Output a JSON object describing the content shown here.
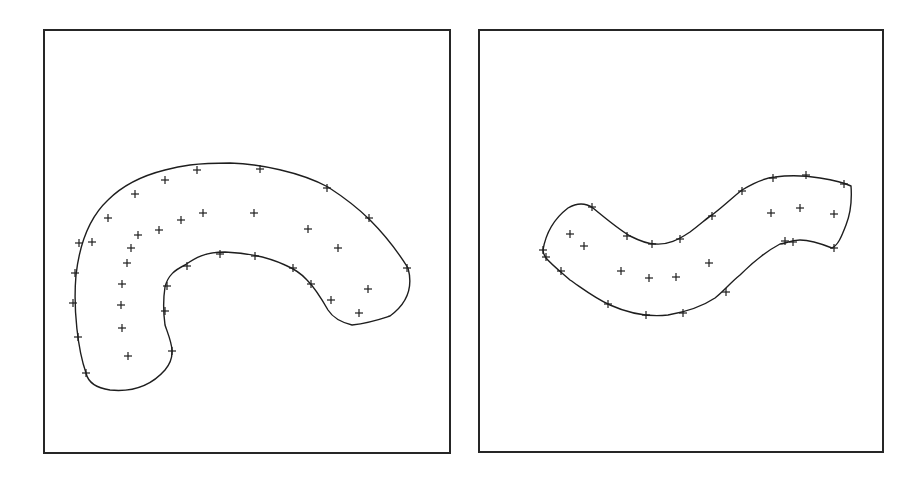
{
  "figure": {
    "panels": [
      {
        "id": "left",
        "shape": "C-shaped curved band",
        "outline_path": "M86,373 C78,350 73,310 76,275 C80,240 92,215 108,200 C125,183 145,175 165,170 C180,166 195,163 230,163 C260,164 300,172 328,187 C345,198 360,210 370,220 C385,235 398,252 408,268 C414,290 405,305 390,316 C378,320 370,323 352,325 C340,322 333,318 328,310 C320,296 312,285 307,280 C300,272 292,268 285,265 C270,258 250,253 225,252 C205,252 195,258 185,265 C175,270 168,275 165,287 C163,300 163,310 165,325 C170,340 178,355 165,370 C150,387 130,392 110,390 C96,388 88,382 86,373 Z",
        "boundary_points": [
          [
            86,
            373
          ],
          [
            78,
            337
          ],
          [
            73,
            303
          ],
          [
            75,
            273
          ],
          [
            79,
            243
          ],
          [
            92,
            242
          ],
          [
            108,
            218
          ],
          [
            135,
            194
          ],
          [
            165,
            180
          ],
          [
            197,
            170
          ],
          [
            260,
            169
          ],
          [
            327,
            188
          ],
          [
            369,
            218
          ],
          [
            407,
            268
          ],
          [
            359,
            313
          ],
          [
            331,
            300
          ],
          [
            311,
            284
          ],
          [
            293,
            268
          ],
          [
            255,
            256
          ],
          [
            220,
            254
          ],
          [
            187,
            266
          ],
          [
            167,
            286
          ],
          [
            165,
            311
          ],
          [
            172,
            351
          ]
        ],
        "interior_points": [
          [
            128,
            356
          ],
          [
            122,
            328
          ],
          [
            121,
            305
          ],
          [
            122,
            284
          ],
          [
            127,
            263
          ],
          [
            131,
            248
          ],
          [
            138,
            235
          ],
          [
            159,
            230
          ],
          [
            181,
            220
          ],
          [
            203,
            213
          ],
          [
            254,
            213
          ],
          [
            308,
            229
          ],
          [
            338,
            248
          ],
          [
            368,
            289
          ]
        ]
      },
      {
        "id": "right",
        "shape": "S-shaped curved band",
        "outline_path": "M543,250 C546,232 555,218 568,208 C578,202 586,203 593,208 C605,218 620,230 630,236 C640,241 648,244 655,244 C668,245 678,240 690,232 C702,223 708,217 712,215 C724,206 733,197 742,190 C755,182 765,178 775,177 C790,175 808,176 820,178 C833,180 843,182 851,186 C852,200 850,215 846,225 C841,238 838,245 832,248 C822,244 810,240 800,240 C790,240 785,244 780,244 C765,252 755,260 740,275 C730,283 725,290 715,298 C700,308 685,312 668,315 C650,317 630,314 610,305 C593,297 582,288 570,280 C561,272 552,265 546,258 C544,255 543,252 543,250 Z",
        "boundary_points": [
          [
            543,
            250
          ],
          [
            546,
            257
          ],
          [
            561,
            271
          ],
          [
            592,
            207
          ],
          [
            627,
            236
          ],
          [
            652,
            244
          ],
          [
            680,
            239
          ],
          [
            712,
            216
          ],
          [
            742,
            191
          ],
          [
            773,
            178
          ],
          [
            806,
            175
          ],
          [
            844,
            184
          ],
          [
            834,
            248
          ],
          [
            793,
            242
          ],
          [
            785,
            241
          ],
          [
            726,
            292
          ],
          [
            683,
            313
          ],
          [
            646,
            315
          ],
          [
            608,
            304
          ]
        ],
        "interior_points": [
          [
            570,
            234
          ],
          [
            584,
            246
          ],
          [
            621,
            271
          ],
          [
            649,
            278
          ],
          [
            676,
            277
          ],
          [
            709,
            263
          ],
          [
            771,
            213
          ],
          [
            800,
            208
          ],
          [
            834,
            214
          ]
        ]
      }
    ]
  }
}
